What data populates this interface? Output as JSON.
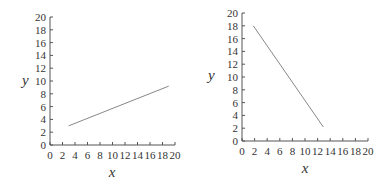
{
  "chart_data": [
    {
      "type": "line",
      "title": "",
      "xlabel": "x",
      "ylabel": "y",
      "xlim": [
        0,
        20
      ],
      "ylim": [
        0,
        20
      ],
      "xticks": [
        "0",
        "2",
        "4",
        "6",
        "8",
        "10",
        "12",
        "14",
        "16",
        "18",
        "20"
      ],
      "yticks": [
        "0",
        "2",
        "4",
        "6",
        "8",
        "10",
        "12",
        "14",
        "16",
        "18",
        "20"
      ],
      "grid": false,
      "series": [
        {
          "name": "line",
          "x": [
            3,
            19
          ],
          "y": [
            3,
            9.2
          ]
        }
      ],
      "line_color": "#888888"
    },
    {
      "type": "line",
      "title": "",
      "xlabel": "x",
      "ylabel": "y",
      "xlim": [
        0,
        20
      ],
      "ylim": [
        0,
        20
      ],
      "xticks": [
        "0",
        "2",
        "4",
        "6",
        "8",
        "10",
        "12",
        "14",
        "16",
        "18",
        "20"
      ],
      "yticks": [
        "0",
        "2",
        "4",
        "6",
        "8",
        "10",
        "12",
        "14",
        "16",
        "18",
        "20"
      ],
      "grid": false,
      "series": [
        {
          "name": "line",
          "x": [
            1.8,
            12.9
          ],
          "y": [
            18,
            2.2
          ]
        }
      ],
      "line_color": "#888888"
    }
  ]
}
